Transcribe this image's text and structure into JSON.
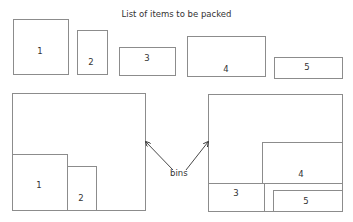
{
  "title": "List of items to be packed",
  "items": [
    {
      "label": "1",
      "x": 13,
      "y": 19,
      "w": 56,
      "h": 56,
      "lx": 40,
      "ly": 51
    },
    {
      "label": "2",
      "x": 77,
      "y": 30,
      "w": 31,
      "h": 45,
      "lx": 91,
      "ly": 62
    },
    {
      "label": "3",
      "x": 119,
      "y": 47,
      "w": 57,
      "h": 29,
      "lx": 147,
      "ly": 58
    },
    {
      "label": "4",
      "x": 187,
      "y": 36,
      "w": 79,
      "h": 41,
      "lx": 226,
      "ly": 69
    },
    {
      "label": "5",
      "x": 274,
      "y": 57,
      "w": 69,
      "h": 22,
      "lx": 307,
      "ly": 67
    }
  ],
  "bins": [
    {
      "name": "left-bin",
      "x": 12,
      "y": 93,
      "w": 134,
      "h": 118,
      "packed": [
        {
          "label": "1",
          "x": 12,
          "y": 154,
          "w": 56,
          "h": 57,
          "lx": 39,
          "ly": 185
        },
        {
          "label": "2",
          "x": 67,
          "y": 166,
          "w": 30,
          "h": 45,
          "lx": 81,
          "ly": 198
        }
      ]
    },
    {
      "name": "right-bin",
      "x": 208,
      "y": 94,
      "w": 135,
      "h": 118,
      "packed": [
        {
          "label": "4",
          "x": 262,
          "y": 142,
          "w": 81,
          "h": 42,
          "lx": 301,
          "ly": 174
        },
        {
          "label": "3",
          "x": 208,
          "y": 183,
          "w": 57,
          "h": 29,
          "lx": 236,
          "ly": 193
        },
        {
          "label": "5",
          "x": 273,
          "y": 190,
          "w": 70,
          "h": 22,
          "lx": 306,
          "ly": 201
        }
      ]
    }
  ],
  "bins_label": "bins",
  "colors": {
    "stroke": "#8c8c8c",
    "arrow": "#333333",
    "text": "#333333"
  }
}
